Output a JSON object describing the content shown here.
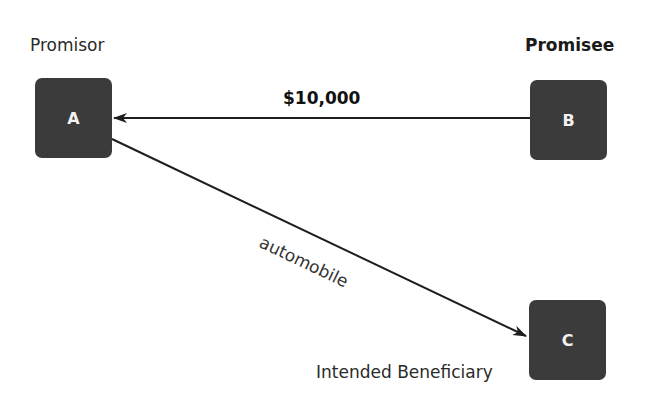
{
  "diagram": {
    "parties": {
      "a": {
        "letter": "A",
        "role": "Promisor"
      },
      "b": {
        "letter": "B",
        "role": "Promisee"
      },
      "c": {
        "letter": "C",
        "role": "Intended Beneficiary"
      }
    },
    "edges": [
      {
        "from": "B",
        "to": "A",
        "label": "$10,000"
      },
      {
        "from": "A",
        "to": "C",
        "label": "automobile"
      }
    ],
    "colors": {
      "node_fill": "#3b3b3b",
      "node_text": "#f2f2f2",
      "line": "#1e1e1e"
    }
  }
}
